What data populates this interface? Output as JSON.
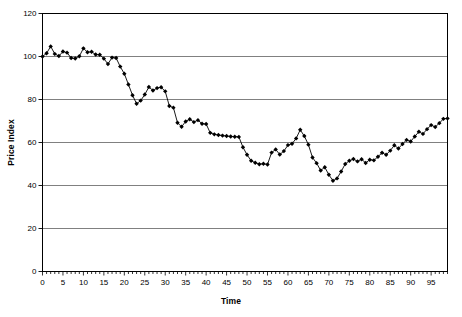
{
  "chart_data": {
    "type": "line",
    "title": "",
    "subtitle": "",
    "xlabel": "Time",
    "ylabel": "Price Index",
    "xlim": [
      0,
      99
    ],
    "ylim": [
      0,
      120
    ],
    "ytick_step": 20,
    "xtick_step": 5,
    "yticks": [
      0,
      20,
      40,
      60,
      80,
      100,
      120
    ],
    "xticks": [
      0,
      5,
      10,
      15,
      20,
      25,
      30,
      35,
      40,
      45,
      50,
      55,
      60,
      65,
      70,
      75,
      80,
      85,
      90,
      95
    ],
    "xtick_labels": [
      "0",
      "5",
      "10",
      "15",
      "20",
      "25",
      "30",
      "35",
      "40",
      "45",
      "50",
      "55",
      "60",
      "65",
      "70",
      "75",
      "80",
      "85",
      "90",
      "95"
    ],
    "ytick_labels": [
      "0",
      "20",
      "40",
      "60",
      "80",
      "100",
      "120"
    ],
    "grid": "horizontal",
    "legend": "none",
    "marker": "filled-diamond",
    "line_color": "#000000",
    "marker_color": "#000000",
    "grid_color": "#808080",
    "frame_color": "#000000",
    "background": "#ffffff",
    "annotations": [],
    "series": [
      {
        "name": "Price Index",
        "x": [
          0,
          1,
          2,
          3,
          4,
          5,
          6,
          7,
          8,
          9,
          10,
          11,
          12,
          13,
          14,
          15,
          16,
          17,
          18,
          19,
          20,
          21,
          22,
          23,
          24,
          25,
          26,
          27,
          28,
          29,
          30,
          31,
          32,
          33,
          34,
          35,
          36,
          37,
          38,
          39,
          40,
          41,
          42,
          43,
          44,
          45,
          46,
          47,
          48,
          49,
          50,
          51,
          52,
          53,
          54,
          55,
          56,
          57,
          58,
          59,
          60,
          61,
          62,
          63,
          64,
          65,
          66,
          67,
          68,
          69,
          70,
          71,
          72,
          73,
          74,
          75,
          76,
          77,
          78,
          79,
          80,
          81,
          82,
          83,
          84,
          85,
          86,
          87,
          88,
          89,
          90,
          91,
          92,
          93,
          94,
          95,
          96,
          97,
          98,
          99
        ],
        "values": [
          100.0,
          101.5,
          104.7,
          101.2,
          100.2,
          102.3,
          101.8,
          99.3,
          99.1,
          100.1,
          103.8,
          102.0,
          102.2,
          100.9,
          100.8,
          99.0,
          96.5,
          99.5,
          99.3,
          95.3,
          92.0,
          87.0,
          82.0,
          78.0,
          79.5,
          82.3,
          85.8,
          84.2,
          85.3,
          85.7,
          83.8,
          77.0,
          76.2,
          69.2,
          67.3,
          69.8,
          70.8,
          69.5,
          70.4,
          68.7,
          68.6,
          64.5,
          63.8,
          63.5,
          63.2,
          63.0,
          62.8,
          62.7,
          62.6,
          57.8,
          54.3,
          51.5,
          50.6,
          49.9,
          50.1,
          49.8,
          55.3,
          56.8,
          54.4,
          56.0,
          58.8,
          59.4,
          61.9,
          65.9,
          63.0,
          59.0,
          53.0,
          50.4,
          47.0,
          48.5,
          45.0,
          42.2,
          43.3,
          46.5,
          50.0,
          51.5,
          52.3,
          51.2,
          52.2,
          50.5,
          52.0,
          51.7,
          53.4,
          55.2,
          54.3,
          56.2,
          58.7,
          57.2,
          59.3,
          61.2,
          60.5,
          62.8,
          65.0,
          64.0,
          66.2,
          68.1,
          67.2,
          69.0,
          71.0,
          71.2
        ]
      }
    ]
  },
  "axes": {
    "y_title": "Price Index",
    "x_title": "Time"
  }
}
